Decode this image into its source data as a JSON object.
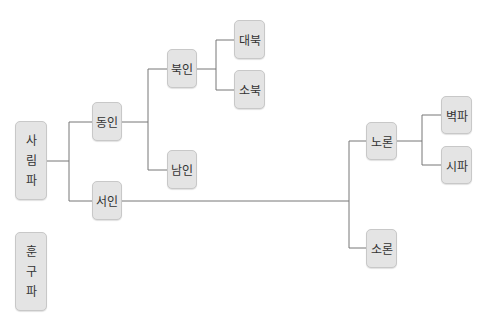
{
  "diagram": {
    "type": "tree",
    "line_color": "#777777",
    "node_fill": "#e4e4e4",
    "nodes": {
      "sarim": {
        "label": "사림파",
        "chars": [
          "사",
          "림",
          "파"
        ]
      },
      "hungu": {
        "label": "훈구파",
        "chars": [
          "훈",
          "구",
          "파"
        ]
      },
      "dongin": {
        "label": "동인"
      },
      "seoin": {
        "label": "서인"
      },
      "bugin": {
        "label": "북인"
      },
      "namin": {
        "label": "남인"
      },
      "daebuk": {
        "label": "대북"
      },
      "sobuk": {
        "label": "소북"
      },
      "noron": {
        "label": "노론"
      },
      "soron": {
        "label": "소론"
      },
      "byeokpa": {
        "label": "벽파"
      },
      "sipa": {
        "label": "시파"
      }
    },
    "edges": [
      [
        "사림파",
        "동인"
      ],
      [
        "사림파",
        "서인"
      ],
      [
        "동인",
        "북인"
      ],
      [
        "동인",
        "남인"
      ],
      [
        "북인",
        "대북"
      ],
      [
        "북인",
        "소북"
      ],
      [
        "서인",
        "노론"
      ],
      [
        "서인",
        "소론"
      ],
      [
        "노론",
        "벽파"
      ],
      [
        "노론",
        "시파"
      ]
    ]
  }
}
